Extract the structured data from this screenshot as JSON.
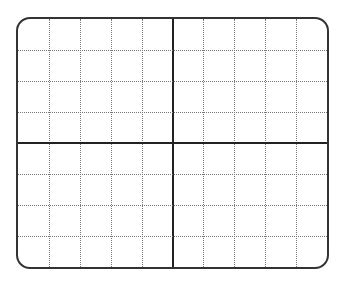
{
  "grid": {
    "columns": 10,
    "rows": 8,
    "frame_color": "#333333",
    "axis_color": "#222222",
    "minor_color": "#777777",
    "corner_radius": 14
  }
}
